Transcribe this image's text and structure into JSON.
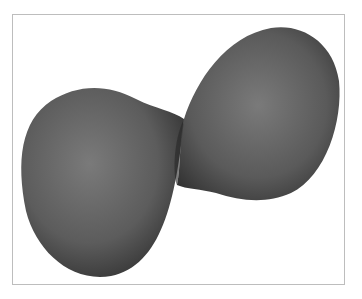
{
  "figure": {
    "colors": {
      "background": "#ffffff",
      "frame_border": "#bdbdbd",
      "surface_light": "#7a7a7a",
      "surface_mid": "#5c5c5c",
      "surface_dark": "#2e2e2e"
    }
  }
}
